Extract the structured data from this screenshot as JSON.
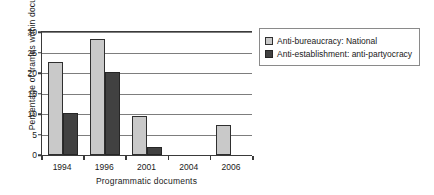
{
  "chart_data": {
    "type": "bar",
    "title": "",
    "xlabel": "Programmatic documents",
    "ylabel": "Percentage of frames within documents",
    "categories": [
      "1994",
      "1996",
      "2001",
      "2004",
      "2006"
    ],
    "series": [
      {
        "name": "Anti-bureaucracy: National",
        "color": "#c9c9c9",
        "values": [
          22.6,
          28.2,
          9.4,
          0,
          7.2
        ]
      },
      {
        "name": "Anti-establishment: anti-partyocracy",
        "color": "#414141",
        "values": [
          10.2,
          20.2,
          1.9,
          0,
          0
        ]
      }
    ],
    "ylim": [
      0,
      30
    ],
    "yticks": [
      0,
      5,
      10,
      15,
      20,
      25,
      30
    ],
    "ytick_labels": [
      "0",
      "5",
      "10",
      "15",
      "20",
      "25",
      "30"
    ],
    "grid": true,
    "legend_position": "right"
  }
}
